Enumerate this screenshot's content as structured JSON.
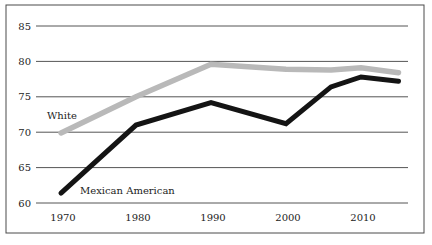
{
  "chart_data": {
    "type": "line",
    "title": "",
    "xlabel": "",
    "ylabel": "",
    "ylim": [
      60,
      85
    ],
    "xlim": [
      1970,
      2015
    ],
    "grid": "horizontal-only",
    "legend_position": "inline-labels",
    "yticks": [
      85,
      80,
      75,
      70,
      65,
      60
    ],
    "xticks": [
      1970,
      1980,
      1990,
      2000,
      2010
    ],
    "colors": {
      "frame": "#4a4a4a",
      "gridline": "#555555",
      "text": "#1c1c1c",
      "white_series": "#b9b9b9",
      "mexican_american_series": "#141414"
    },
    "series": [
      {
        "name": "White",
        "color": "#b9b9b9",
        "points": [
          [
            1970,
            69.9
          ],
          [
            1980,
            75.0
          ],
          [
            1990,
            79.6
          ],
          [
            2000,
            78.9
          ],
          [
            2006,
            78.8
          ],
          [
            2010,
            79.1
          ],
          [
            2015,
            78.4
          ]
        ]
      },
      {
        "name": "Mexican American",
        "color": "#141414",
        "points": [
          [
            1970,
            61.4
          ],
          [
            1980,
            71.0
          ],
          [
            1990,
            74.2
          ],
          [
            2000,
            71.2
          ],
          [
            2006,
            76.4
          ],
          [
            2010,
            77.8
          ],
          [
            2015,
            77.2
          ]
        ]
      }
    ]
  }
}
